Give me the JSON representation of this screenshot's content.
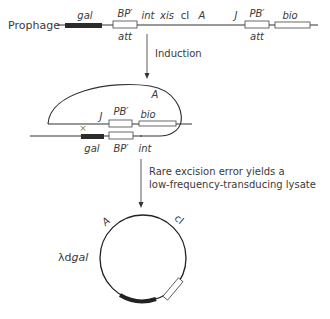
{
  "prophage": {
    "title": "Prophage",
    "genes_above": {
      "gal": "gal",
      "bp": "BP′",
      "int": "int",
      "xis": "xis",
      "ci": "cI",
      "a": "A",
      "j": "J",
      "pb": "PB′",
      "bio": "bio"
    },
    "genes_below": {
      "att1": "att",
      "att2": "att"
    }
  },
  "step1": {
    "label": "Induction"
  },
  "loop": {
    "a": "A",
    "j": "J",
    "pb": "PB′",
    "bio": "bio",
    "cross": "×",
    "gal": "gal",
    "bp": "BP′",
    "int": "int"
  },
  "step2": {
    "line1": "Rare excision error yields a",
    "line2": "low-frequency-transducing lysate"
  },
  "circle": {
    "name_prefix": "λd",
    "name_suffix": "gal",
    "a": "A",
    "ci": "cI"
  },
  "colors": {
    "line": "#333333",
    "gene_fill": "#2b2b2b",
    "box_fill": "#ffffff"
  }
}
